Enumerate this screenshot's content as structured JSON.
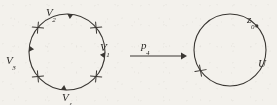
{
  "figure": {
    "kind": "commutative-diagram-covering-map",
    "stroke_color": "#3a3733",
    "text_color": "#2b2926",
    "background_color": "#f3f1ec",
    "left_circle": {
      "label": "left-circle",
      "center_x": 67,
      "center_y": 52,
      "radius": 38,
      "cross_marks": 4,
      "cross_angles_deg": [
        40,
        140,
        220,
        320
      ],
      "arrow_marks": 4,
      "arrow_angles_deg": [
        85,
        175,
        265,
        355
      ],
      "vertex_labels": [
        {
          "name": "V1",
          "base": "V",
          "sub": "1",
          "position": "right"
        },
        {
          "name": "V2",
          "base": "V",
          "sub": "2",
          "position": "top"
        },
        {
          "name": "V3",
          "base": "V",
          "sub": "3",
          "position": "left"
        },
        {
          "name": "V4",
          "base": "V",
          "sub": "4",
          "position": "bottom"
        }
      ]
    },
    "map_arrow": {
      "label_base": "p",
      "label_sub": "4",
      "x_start": 130,
      "x_end": 186,
      "y": 56,
      "direction": "right"
    },
    "right_circle": {
      "label": "right-circle",
      "center_x": 230,
      "center_y": 50,
      "radius": 36,
      "cross_marks": 1,
      "cross_angles_deg": [
        215
      ],
      "basepoint": {
        "base": "z",
        "sub": "0",
        "angle_deg": 42
      },
      "set_label": "U"
    }
  }
}
